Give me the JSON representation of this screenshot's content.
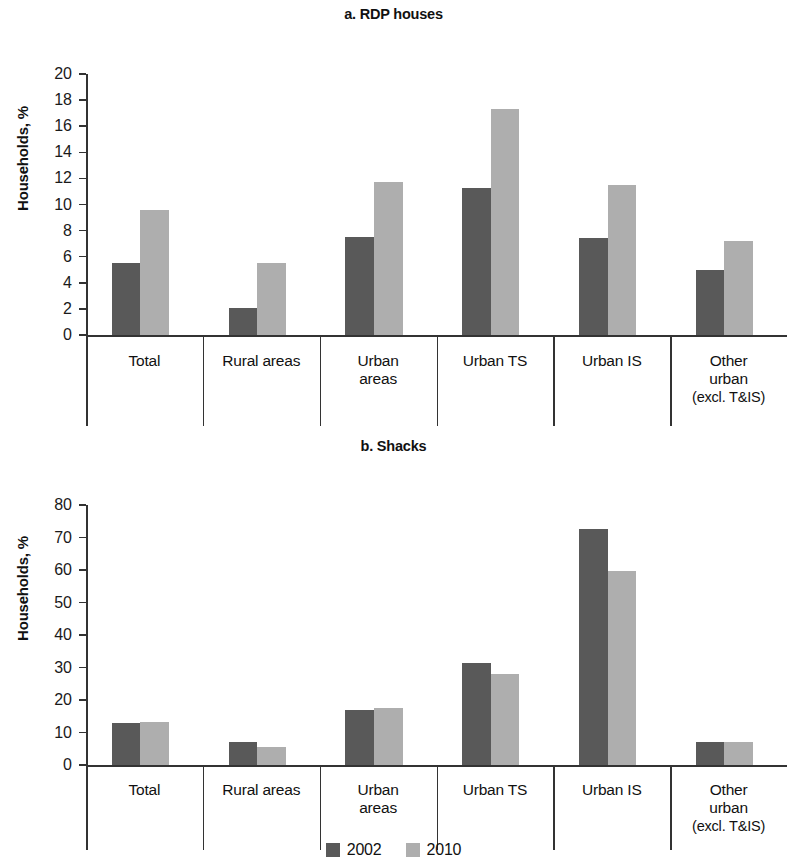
{
  "figure": {
    "series_colors": {
      "2002": "#595959",
      "2010": "#aeaeae"
    },
    "legend": [
      {
        "label": "2002",
        "color": "#595959"
      },
      {
        "label": "2010",
        "color": "#aeaeae"
      }
    ]
  },
  "panels": [
    {
      "id": "a",
      "title": "a. RDP houses",
      "ylabel": "Households, %"
    },
    {
      "id": "b",
      "title": "b. Shacks",
      "ylabel": "Households, %"
    }
  ],
  "categories": [
    {
      "line1": "Total",
      "line2": "",
      "line3": ""
    },
    {
      "line1": "Rural areas",
      "line2": "",
      "line3": ""
    },
    {
      "line1": "Urban",
      "line2": "areas",
      "line3": ""
    },
    {
      "line1": "Urban TS",
      "line2": "",
      "line3": ""
    },
    {
      "line1": "Urban IS",
      "line2": "",
      "line3": ""
    },
    {
      "line1": "Other",
      "line2": "urban",
      "line3": "(excl. T&IS)"
    }
  ],
  "chart_data": [
    {
      "type": "bar",
      "title": "a. RDP houses",
      "xlabel": "",
      "ylabel": "Households, %",
      "ylim": [
        0,
        20
      ],
      "yticks": [
        0,
        2,
        4,
        6,
        8,
        10,
        12,
        14,
        16,
        18,
        20
      ],
      "grid": false,
      "legend_position": "bottom-center (shared)",
      "categories": [
        "Total",
        "Rural areas",
        "Urban areas",
        "Urban TS",
        "Urban IS",
        "Other urban (excl. T&IS)"
      ],
      "series": [
        {
          "name": "2002",
          "color": "#595959",
          "values": [
            5.5,
            2.1,
            7.5,
            11.3,
            7.4,
            5.0
          ]
        },
        {
          "name": "2010",
          "color": "#aeaeae",
          "values": [
            9.6,
            5.5,
            11.7,
            17.3,
            11.5,
            7.2
          ]
        }
      ]
    },
    {
      "type": "bar",
      "title": "b. Shacks",
      "xlabel": "",
      "ylabel": "Households, %",
      "ylim": [
        0,
        80
      ],
      "yticks": [
        0,
        10,
        20,
        30,
        40,
        50,
        60,
        70,
        80
      ],
      "grid": false,
      "legend_position": "bottom-center (shared)",
      "categories": [
        "Total",
        "Rural areas",
        "Urban areas",
        "Urban TS",
        "Urban IS",
        "Other urban (excl. T&IS)"
      ],
      "series": [
        {
          "name": "2002",
          "color": "#595959",
          "values": [
            13.0,
            7.0,
            17.0,
            31.5,
            72.5,
            7.0
          ]
        },
        {
          "name": "2010",
          "color": "#aeaeae",
          "values": [
            13.2,
            5.5,
            17.5,
            28.0,
            59.7,
            7.2
          ]
        }
      ]
    }
  ]
}
